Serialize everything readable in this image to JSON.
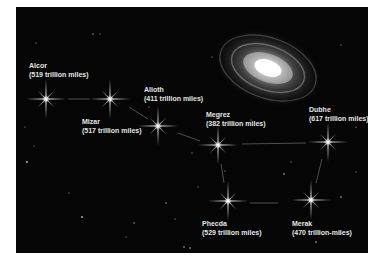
{
  "figure": {
    "background_color": "#050505",
    "label_color": "#e6e6e6",
    "galaxy": {
      "name": "spiral-galaxy",
      "cx": 252,
      "cy": 61
    },
    "stars": [
      {
        "name": "Alcor",
        "distance": "(519 trillion miles)",
        "x": 30,
        "y": 92
      },
      {
        "name": "Mizar",
        "distance": "(517 trillion miles)",
        "x": 94,
        "y": 92
      },
      {
        "name": "Alioth",
        "distance": "(411 trillion miles)",
        "x": 142,
        "y": 119
      },
      {
        "name": "Megrez",
        "distance": "(382 trillion miles)",
        "x": 202,
        "y": 138
      },
      {
        "name": "Dubhe",
        "distance": "(617 trillion miles)",
        "x": 312,
        "y": 135
      },
      {
        "name": "Phecda",
        "distance": "(529 trillion miles)",
        "x": 212,
        "y": 194
      },
      {
        "name": "Merak",
        "distance": "(470 trillion-miles)",
        "x": 295,
        "y": 193
      }
    ]
  }
}
